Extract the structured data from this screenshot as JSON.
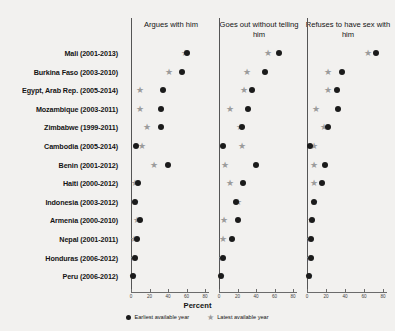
{
  "chart_data": {
    "type": "scatter",
    "title": "",
    "xlabel": "Percent",
    "ylabel": "",
    "xlim": [
      0,
      80
    ],
    "xticks": [
      0,
      20,
      40,
      60,
      80
    ],
    "grid": false,
    "legend_position": "bottom",
    "legend": [
      {
        "name": "Earliest available year",
        "marker": "dot",
        "color": "#1b1b1b"
      },
      {
        "name": "Latest available year",
        "marker": "star",
        "color": "#9b9b9b"
      }
    ],
    "panels": [
      {
        "label": "Argues with him"
      },
      {
        "label": "Goes out without telling him"
      },
      {
        "label": "Refuses to have sex with him"
      }
    ],
    "categories": [
      "Mali (2001-2013)",
      "Burkina Faso (2003-2010)",
      "Egypt, Arab Rep. (2005-2014)",
      "Mozambique (2003-2011)",
      "Zimbabwe (1999-2011)",
      "Cambodia (2005-2014)",
      "Benin (2001-2012)",
      "Haiti (2000-2012)",
      "Indonesia (2003-2012)",
      "Armenia (2000-2010)",
      "Nepal (2001-2011)",
      "Honduras (2006-2012)",
      "Peru (2006-2012)"
    ],
    "series": [
      {
        "panel": "Argues with him",
        "earliest": [
          61,
          55,
          35,
          32,
          32,
          5,
          40,
          8,
          4,
          10,
          7,
          4,
          2
        ],
        "latest": [
          58,
          41,
          10,
          10,
          17,
          12,
          25,
          4,
          4,
          6,
          3,
          3,
          2
        ]
      },
      {
        "panel": "Goes out without telling him",
        "earliest": [
          65,
          50,
          36,
          31,
          25,
          4,
          40,
          26,
          18,
          21,
          14,
          4,
          2
        ],
        "latest": [
          53,
          30,
          27,
          12,
          23,
          25,
          6,
          12,
          21,
          5,
          4,
          3,
          2
        ]
      },
      {
        "panel": "Refuses to have sex with him",
        "earliest": [
          73,
          37,
          32,
          33,
          22,
          3,
          19,
          16,
          7,
          5,
          4,
          4,
          2
        ],
        "latest": [
          64,
          22,
          22,
          9,
          18,
          7,
          7,
          7,
          7,
          4,
          3,
          3,
          2
        ]
      }
    ]
  }
}
